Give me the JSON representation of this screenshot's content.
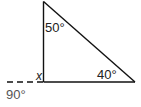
{
  "diagram": {
    "shape": "right triangle",
    "labels": {
      "top_angle": "50°",
      "right_angle_label": "40°",
      "unknown_angle": "x",
      "exterior_angle": "90°"
    },
    "vertices": {
      "top": [
        43.5,
        1.5
      ],
      "bottom_left": [
        43.5,
        82
      ],
      "bottom_right": [
        135,
        82
      ]
    },
    "extension_line": {
      "style": "dashed",
      "from": [
        7,
        82
      ],
      "to": [
        43.5,
        82
      ]
    },
    "colors": {
      "line": "#111111",
      "text": "#222222",
      "exterior_text": "#555555",
      "background": "#ffffff"
    }
  }
}
